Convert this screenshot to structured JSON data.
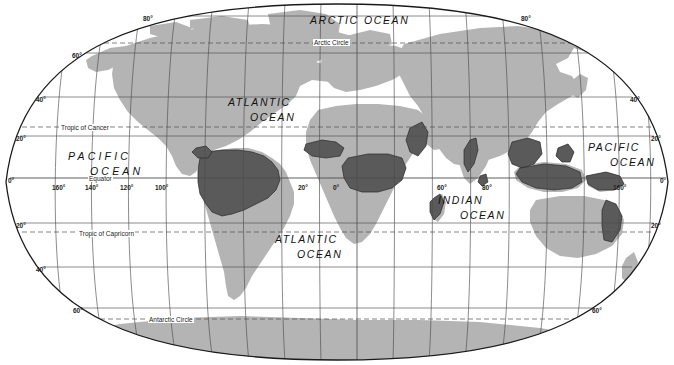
{
  "map": {
    "title": "World map showing tropical rainforest distribution",
    "projection": "elliptical",
    "colors": {
      "ocean": "#ffffff",
      "land": "#b3b3b3",
      "highlight": "#595959",
      "graticule": "#555555",
      "border": "#1a1a1a",
      "text": "#1a1a1a"
    },
    "ocean_labels": [
      {
        "id": "arctic-ocean",
        "lines": [
          "ARCTIC",
          "OCEAN"
        ],
        "x": 310,
        "y": 14,
        "gap": 54,
        "spaced": false
      },
      {
        "id": "atlantic-ocean-n",
        "lines": [
          "ATLANTIC",
          "OCEAN"
        ],
        "x": 228,
        "y": 96,
        "gap": 0,
        "spaced": false
      },
      {
        "id": "pacific-ocean-w",
        "lines": [
          "PACIFIC",
          "OCEAN"
        ],
        "x": 68,
        "y": 150,
        "gap": 0,
        "spaced": true
      },
      {
        "id": "pacific-ocean-e",
        "lines": [
          "PACIFIC",
          "OCEAN"
        ],
        "x": 588,
        "y": 141,
        "gap": 0,
        "spaced": false
      },
      {
        "id": "indian-ocean",
        "lines": [
          "INDIAN",
          "OCEAN"
        ],
        "x": 438,
        "y": 194,
        "gap": 0,
        "spaced": false
      },
      {
        "id": "atlantic-ocean-s",
        "lines": [
          "ATLANTIC",
          "OCEAN"
        ],
        "x": 275,
        "y": 233,
        "gap": 0,
        "spaced": false
      }
    ],
    "special_lines": [
      {
        "id": "arctic-circle",
        "label": "Arctic Circle",
        "x": 313,
        "y": 39
      },
      {
        "id": "tropic-of-cancer",
        "label": "Tropic of Cancer",
        "x": 60,
        "y": 124
      },
      {
        "id": "equator",
        "label": "Equator",
        "x": 88,
        "y": 175
      },
      {
        "id": "tropic-of-capricorn",
        "label": "Tropic of Capricorn",
        "x": 78,
        "y": 230
      },
      {
        "id": "antarctic-circle",
        "label": "Antarctic Circle",
        "x": 148,
        "y": 316
      }
    ],
    "latitude_labels_left": [
      {
        "value": "80°",
        "x": 143,
        "y": 15
      },
      {
        "value": "60°",
        "x": 72,
        "y": 52
      },
      {
        "value": "40°",
        "x": 36,
        "y": 96
      },
      {
        "value": "20°",
        "x": 16,
        "y": 135
      },
      {
        "value": "0°",
        "x": 8,
        "y": 177
      },
      {
        "value": "20°",
        "x": 16,
        "y": 222
      },
      {
        "value": "40°",
        "x": 36,
        "y": 266
      },
      {
        "value": "60°",
        "x": 73,
        "y": 307
      }
    ],
    "latitude_labels_right": [
      {
        "value": "80°",
        "x": 521,
        "y": 15
      },
      {
        "value": "40°",
        "x": 630,
        "y": 96
      },
      {
        "value": "20°",
        "x": 651,
        "y": 135
      },
      {
        "value": "0°",
        "x": 660,
        "y": 177
      },
      {
        "value": "20°",
        "x": 651,
        "y": 222
      },
      {
        "value": "60°",
        "x": 592,
        "y": 307
      }
    ],
    "longitude_labels": [
      {
        "value": "160°",
        "x": 52,
        "y": 184
      },
      {
        "value": "140°",
        "x": 85,
        "y": 184
      },
      {
        "value": "120°",
        "x": 120,
        "y": 184
      },
      {
        "value": "100°",
        "x": 155,
        "y": 184
      },
      {
        "value": "20°",
        "x": 298,
        "y": 184
      },
      {
        "value": "0°",
        "x": 333,
        "y": 184
      },
      {
        "value": "60°",
        "x": 437,
        "y": 184
      },
      {
        "value": "80°",
        "x": 482,
        "y": 184
      },
      {
        "value": "160°",
        "x": 613,
        "y": 184
      }
    ]
  }
}
